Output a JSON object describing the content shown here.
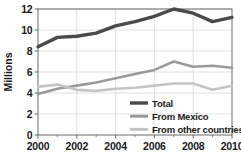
{
  "chart_data": {
    "type": "line",
    "title": "",
    "subtitle": "",
    "xlabel": "",
    "ylabel": "Millions",
    "x": [
      2000,
      2001,
      2002,
      2003,
      2004,
      2005,
      2006,
      2007,
      2008,
      2009,
      2010
    ],
    "xlim": [
      2000,
      2010
    ],
    "ylim": [
      0,
      12
    ],
    "xticks": [
      2000,
      2002,
      2004,
      2006,
      2008,
      2010
    ],
    "xtick_labels": [
      "2000",
      "2002",
      "2004",
      "2006",
      "2008",
      "2010"
    ],
    "yticks": [
      0,
      2,
      4,
      6,
      8,
      10,
      12
    ],
    "ytick_labels": [
      "0",
      "2",
      "4",
      "6",
      "8",
      "10",
      "12"
    ],
    "grid": "horizontal-and-vertical",
    "legend_position": "lower-right-inside",
    "series": [
      {
        "name": "Total",
        "color": "#4a4a4a",
        "width": 3.4,
        "values": [
          8.4,
          9.3,
          9.4,
          9.7,
          10.4,
          10.8,
          11.3,
          12.0,
          11.6,
          10.8,
          11.2
        ]
      },
      {
        "name": "From Mexico",
        "color": "#9a9a9a",
        "width": 2.6,
        "values": [
          3.9,
          4.4,
          4.7,
          5.0,
          5.4,
          5.8,
          6.2,
          7.0,
          6.5,
          6.6,
          6.4
        ]
      },
      {
        "name": "From other countries",
        "color": "#c4c4c4",
        "width": 2.6,
        "values": [
          4.6,
          4.8,
          4.3,
          4.2,
          4.4,
          4.5,
          4.7,
          4.9,
          4.9,
          4.3,
          4.7
        ]
      }
    ]
  },
  "axes": {
    "y_title": "Millions"
  },
  "legend": {
    "items": [
      {
        "label": "Total"
      },
      {
        "label": "From Mexico"
      },
      {
        "label": "From other countries"
      }
    ]
  },
  "style": {
    "plot_border": "#6b6b6b",
    "grid_color": "#d8d8d8",
    "background": "#ffffff",
    "text_color": "#1a1a1a"
  }
}
